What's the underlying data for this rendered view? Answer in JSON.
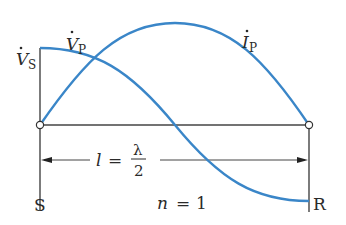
{
  "diagram": {
    "colors": {
      "wave": "#3a86c8",
      "line": "#444444",
      "text": "#2a2a2a"
    },
    "labels": {
      "vs_main": "V",
      "vs_sub": "S",
      "vp_main": "V",
      "vp_sub": "P",
      "ip_main": "I",
      "ip_sub": "P",
      "length_var": "l",
      "equals": "=",
      "lambda": "λ",
      "denominator": "2",
      "sending_end": "S",
      "receiving_end": "R",
      "mode_var": "n",
      "mode_eq": "=",
      "mode_val": "1"
    },
    "curves": [
      {
        "name": "voltage",
        "label": "V_P",
        "shape": "cosine",
        "start": "max at S",
        "end": "min at R"
      },
      {
        "name": "current",
        "label": "I_P",
        "shape": "sine",
        "start": "zero at S",
        "end": "zero at R"
      }
    ]
  }
}
